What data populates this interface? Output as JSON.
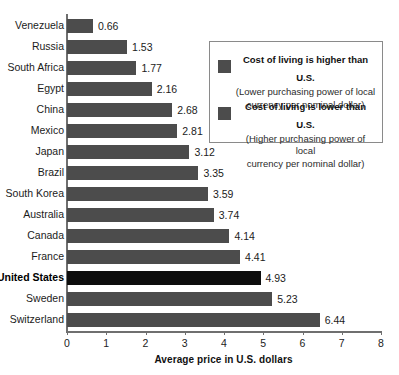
{
  "chart_data": {
    "type": "bar",
    "orientation": "horizontal",
    "title": "",
    "subtitle": "",
    "xlabel": "Average price in U.S. dollars",
    "ylabel": "",
    "xlim": [
      0,
      8
    ],
    "xticks": [
      0,
      1,
      2,
      3,
      4,
      5,
      6,
      7,
      8
    ],
    "xtick_labels": [
      "0",
      "1",
      "2",
      "3",
      "4",
      "5",
      "6",
      "7",
      "8"
    ],
    "grid": false,
    "legend_position": "upper-right-inset",
    "categories": [
      "Venezuela",
      "Russia",
      "South Africa",
      "Egypt",
      "China",
      "Mexico",
      "Japan",
      "Brazil",
      "South Korea",
      "Australia",
      "Canada",
      "France",
      "United States",
      "Sweden",
      "Switzerland"
    ],
    "values": [
      0.66,
      1.53,
      1.77,
      2.16,
      2.68,
      2.81,
      3.12,
      3.35,
      3.59,
      3.74,
      4.14,
      4.41,
      4.93,
      5.23,
      6.44
    ],
    "value_labels": [
      "0.66",
      "1.53",
      "1.77",
      "2.16",
      "2.68",
      "2.81",
      "3.12",
      "3.35",
      "3.59",
      "3.74",
      "4.14",
      "4.41",
      "4.93",
      "5.23",
      "6.44"
    ],
    "highlight_category": "United States",
    "colors": {
      "bar": "#4c4c4c",
      "highlight_bar": "#0d0d0d",
      "axis": "#6f6f6f",
      "text": "#1b1b1b",
      "legend_border": "#8a8a8a",
      "background": "#ffffff"
    }
  },
  "legend": {
    "entries": [
      {
        "swatch_color": "#4c4c4c",
        "title": "Cost of living is higher than U.S.",
        "subtitle_line1": "(Lower purchasing power of local",
        "subtitle_line2": "currency per nominal dollar)"
      },
      {
        "swatch_color": "#4c4c4c",
        "title": "Cost of living is lower than U.S.",
        "subtitle_line1": "(Higher purchasing power of local",
        "subtitle_line2": "currency per nominal dollar)"
      }
    ]
  }
}
